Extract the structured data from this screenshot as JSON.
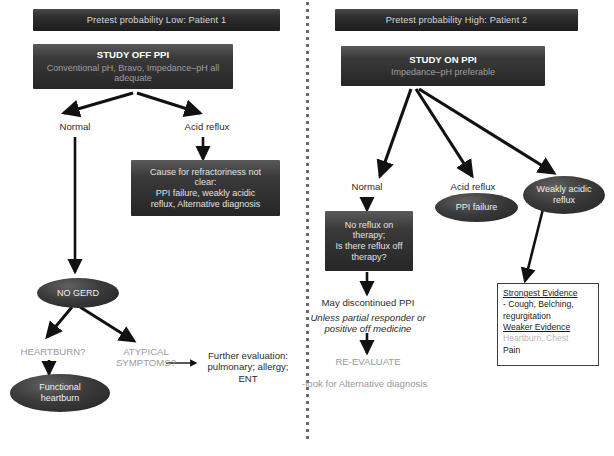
{
  "figure": {
    "type": "clinical-decision-flowchart",
    "divider": "vertical dotted line separating two patient pathways"
  },
  "left_panel": {
    "header": "Pretest probability Low: Patient 1",
    "study_box": {
      "title": "STUDY OFF PPI",
      "subtitle": "Conventional pH, Bravo, Impedance–pH all adequate"
    },
    "branch_normal": "Normal",
    "branch_acid_reflux": "Acid reflux",
    "cause_box": "Cause for refractoriness not clear:\nPPI failure, weakly acidic reflux, Alternative diagnosis",
    "cause_box_lines": [
      "Cause for refractoriness not",
      "clear:",
      "PPI failure, weakly acidic",
      "reflux, Alternative diagnosis"
    ],
    "no_gerd": "NO GERD",
    "heartburn_q": "HEARTBURN?",
    "atypical_q_lines": [
      "ATYPICAL",
      "SYMPTOMS?"
    ],
    "functional_heartburn_lines": [
      "Functional",
      "heartburn"
    ],
    "further_eval_lines": [
      "Further evaluation:",
      "pulmonary; allergy;",
      "ENT"
    ]
  },
  "right_panel": {
    "header": "Pretest probability High: Patient 2",
    "study_box": {
      "title": "STUDY ON PPI",
      "subtitle": "Impedance–pH preferable"
    },
    "branch_normal": "Normal",
    "branch_acid_reflux": "Acid reflux",
    "ppi_failure": "PPI failure",
    "weakly_acidic_reflux_lines": [
      "Weakly acidic",
      "reflux"
    ],
    "no_reflux_box_lines": [
      "No reflux on",
      "therapy;",
      "Is there reflux off",
      "therapy?"
    ],
    "may_discontinue": "May discontinued PPI",
    "unless_lines": [
      "Unless partial responder or",
      "positive off medicine"
    ],
    "re_evaluate": "RE-EVALUATE",
    "look_alt": "-look for Alternative diagnosis",
    "evidence_box": {
      "strongest_title": "Strongest Evidence",
      "strongest_items": [
        "- Cough, Belching,",
        "regurgitation"
      ],
      "weaker_title": "Weaker Evidence",
      "weaker_items": [
        "Heartburn, Chest",
        "Pain"
      ]
    }
  },
  "colors": {
    "bar_dark": "#2e2e2e",
    "box_dark": "#3a3a3a",
    "oval_dark": "#3b3b3b",
    "text_light": "#e2e2e2",
    "text_muted": "#9e9e9e",
    "text_body": "#2b2b2b",
    "faded_gray": "#9a9a9a",
    "arrow": "#111111",
    "box_border": "#3d3d3d"
  }
}
